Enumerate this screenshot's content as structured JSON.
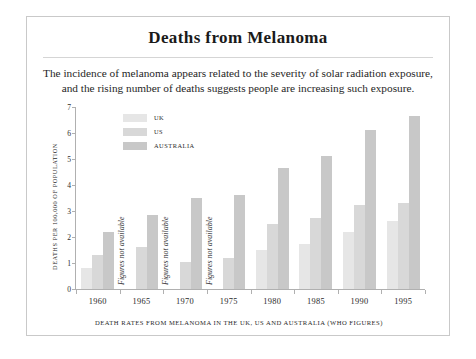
{
  "card": {
    "title": "Deaths from Melanoma",
    "subtitle_line1": "The incidence of melanoma appears related to the severity of solar radiation exposure,",
    "subtitle_line2": "and the rising number of deaths suggests people are increasing such exposure."
  },
  "chart_data": {
    "type": "bar",
    "title": "Deaths from Melanoma",
    "caption": "DEATH RATES FROM MELANOMA IN THE UK, US AND AUSTRALIA (WHO FIGURES)",
    "xlabel": "",
    "ylabel": "DEATHS PER 100,000 OF POPULATION",
    "ylim": [
      0,
      7
    ],
    "yticks": [
      0,
      1,
      2,
      3,
      4,
      5,
      6,
      7
    ],
    "grid": false,
    "legend_position": "top-left",
    "categories": [
      "1960",
      "1965",
      "1970",
      "1975",
      "1980",
      "1985",
      "1990",
      "1995"
    ],
    "series": [
      {
        "name": "UK",
        "color": "#e6e6e6",
        "values": [
          0.8,
          null,
          null,
          null,
          1.5,
          1.75,
          2.2,
          2.6
        ]
      },
      {
        "name": "US",
        "color": "#d8d8d8",
        "values": [
          1.3,
          1.6,
          1.05,
          1.2,
          2.5,
          2.75,
          3.25,
          3.3
        ]
      },
      {
        "name": "AUSTRALIA",
        "color": "#c8c8c8",
        "values": [
          2.2,
          2.85,
          3.5,
          3.6,
          4.65,
          5.1,
          6.1,
          6.65
        ]
      }
    ],
    "missing_label": "Figures not available",
    "missing_categories": [
      "1965",
      "1970",
      "1975"
    ]
  }
}
